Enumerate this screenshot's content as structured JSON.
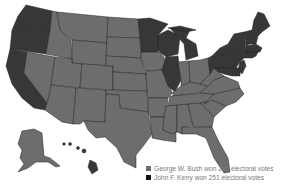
{
  "map": {
    "title": "2004 US Presidential Election Electoral Map",
    "colors": {
      "bush": "#6d6d6d",
      "kerry": "#373737",
      "border": "#222222",
      "background": "#ffffff"
    },
    "states": {
      "WA": "kerry",
      "OR": "kerry",
      "CA": "kerry",
      "NV": "bush",
      "ID": "bush",
      "MT": "bush",
      "WY": "bush",
      "UT": "bush",
      "AZ": "bush",
      "CO": "bush",
      "NM": "bush",
      "ND": "bush",
      "SD": "bush",
      "NE": "bush",
      "KS": "bush",
      "OK": "bush",
      "TX": "bush",
      "MN": "kerry",
      "IA": "bush",
      "MO": "bush",
      "AR": "bush",
      "LA": "bush",
      "WI": "kerry",
      "IL": "kerry",
      "MI": "kerry",
      "IN": "bush",
      "OH": "bush",
      "KY": "bush",
      "TN": "bush",
      "MS": "bush",
      "AL": "bush",
      "GA": "bush",
      "FL": "bush",
      "SC": "bush",
      "NC": "bush",
      "VA": "bush",
      "WV": "bush",
      "PA": "kerry",
      "NY": "kerry",
      "VT": "kerry",
      "NH": "kerry",
      "ME": "kerry",
      "MA": "kerry",
      "CT": "kerry",
      "RI": "kerry",
      "NJ": "kerry",
      "DE": "kerry",
      "MD": "kerry",
      "DC": "kerry",
      "AK": "bush",
      "HI": "kerry"
    }
  },
  "legend": {
    "items": [
      {
        "label": "George W. Bush won 286 electoral votes",
        "color": "#6d6d6d"
      },
      {
        "label": "John F. Kerry won 251 electoral votes",
        "color": "#111111"
      }
    ]
  }
}
